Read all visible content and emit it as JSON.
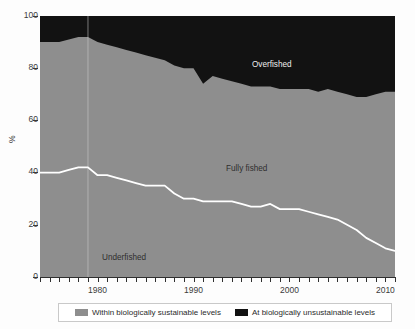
{
  "chart_data": {
    "type": "area",
    "title": "",
    "subtitle": "",
    "xlabel": "",
    "ylabel": "%",
    "xlim": [
      1974,
      2011
    ],
    "ylim": [
      0,
      100
    ],
    "grid": false,
    "legend_position": "bottom",
    "x_tick_labels": [
      "1980",
      "1990",
      "2000",
      "2010"
    ],
    "x_tick_values": [
      1980,
      1990,
      2000,
      2010
    ],
    "x_minor_tick_step": 1,
    "y_tick_labels": [
      "0",
      "20",
      "40",
      "60",
      "80",
      "100"
    ],
    "y_tick_values": [
      0,
      20,
      40,
      60,
      80,
      100
    ],
    "colors": {
      "sustainable": "#8e8e8e",
      "unsustainable": "#121212",
      "divider_line": "#ffffff",
      "axis": "#3b3b3b",
      "background": "#ffffff"
    },
    "x": [
      1974,
      1975,
      1976,
      1977,
      1978,
      1979,
      1980,
      1981,
      1982,
      1983,
      1984,
      1985,
      1986,
      1987,
      1988,
      1989,
      1990,
      1991,
      1992,
      1993,
      1994,
      1995,
      1996,
      1997,
      1998,
      1999,
      2000,
      2001,
      2002,
      2003,
      2004,
      2005,
      2006,
      2007,
      2008,
      2009,
      2010,
      2011
    ],
    "series": [
      {
        "name": "Within biologically sustainable levels",
        "label": "Within biologically sustainable levels",
        "color": "#8e8e8e",
        "stack": "bottom",
        "values": [
          90,
          90,
          90,
          91,
          92,
          92,
          90,
          89,
          88,
          87,
          86,
          85,
          84,
          83,
          81,
          80,
          80,
          74,
          77,
          76,
          75,
          74,
          73,
          73,
          73,
          72,
          72,
          72,
          72,
          71,
          72,
          71,
          70,
          69,
          69,
          70,
          71,
          71
        ]
      },
      {
        "name": "At biologically unsustainable levels",
        "label": "At biologically unsustainable levels",
        "color": "#121212",
        "stack": "top",
        "values": [
          10,
          10,
          10,
          9,
          8,
          8,
          10,
          11,
          12,
          13,
          14,
          15,
          16,
          17,
          19,
          20,
          20,
          26,
          23,
          24,
          25,
          26,
          27,
          27,
          27,
          28,
          28,
          28,
          28,
          29,
          28,
          29,
          30,
          31,
          31,
          30,
          29,
          29
        ]
      }
    ],
    "divider_series": {
      "name": "Underfished upper boundary",
      "label": "Underfished",
      "color": "#ffffff",
      "values": [
        40,
        40,
        40,
        41,
        42,
        42,
        39,
        39,
        38,
        37,
        36,
        35,
        35,
        35,
        32,
        30,
        30,
        29,
        29,
        29,
        29,
        28,
        27,
        27,
        28,
        26,
        26,
        26,
        25,
        24,
        23,
        22,
        20,
        18,
        15,
        13,
        11,
        10
      ]
    },
    "region_labels": {
      "overfished": "Overfished",
      "fully_fished": "Fully fished",
      "underfished": "Underfished"
    },
    "marker_year": 1979
  },
  "axes": {
    "y_title": "%",
    "y_ticks": [
      "100",
      "80",
      "60",
      "40",
      "20",
      "0"
    ],
    "x_ticks": [
      "1980",
      "1990",
      "2000",
      "2010"
    ]
  },
  "legend": {
    "items": [
      {
        "label": "Within biologically sustainable levels",
        "color": "#8e8e8e"
      },
      {
        "label": "At biologically unsustainable levels",
        "color": "#121212"
      }
    ]
  }
}
